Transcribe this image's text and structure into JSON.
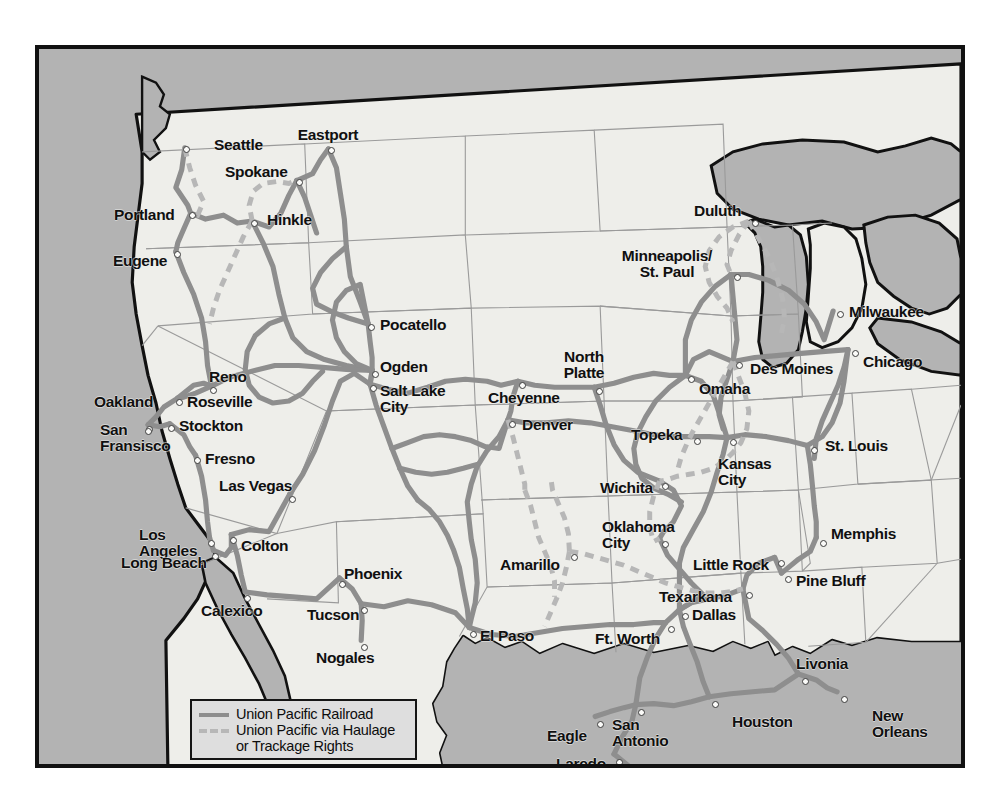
{
  "map": {
    "title": "Union Pacific Railroad System Map",
    "colors": {
      "ocean": "#b3b3b3",
      "land": "#eeeeea",
      "lakes": "#b3b3b3",
      "rail_line": "#8e8e8e",
      "haulage_line": "#b7b7b7",
      "border": "#111111",
      "state_line": "#9a9a9a",
      "label_text": "#101010",
      "legend_background": "#dedede",
      "page_background": "#ffffff",
      "city_dot_fill": "#fbfbf9",
      "city_dot_stroke": "#3c3c3c"
    },
    "frame": {
      "left": 35,
      "top": 45,
      "width": 930,
      "height": 723
    }
  },
  "legend": {
    "items": [
      {
        "style": "solid",
        "label": "Union Pacific Railroad"
      },
      {
        "style": "dashed",
        "label": "Union Pacific via Haulage\nor Trackage Rights"
      }
    ]
  },
  "cities": [
    {
      "name": "Seattle",
      "label": "Seattle",
      "dot_x": 147,
      "dot_y": 100,
      "label_x": 175,
      "label_y": 88,
      "align": "left"
    },
    {
      "name": "Eastport",
      "label": "Eastport",
      "dot_x": 292,
      "dot_y": 101,
      "label_x": 289,
      "label_y": 78,
      "align": "center"
    },
    {
      "name": "Spokane",
      "label": "Spokane",
      "dot_x": 260,
      "dot_y": 133,
      "label_x": 186,
      "label_y": 115,
      "align": "left"
    },
    {
      "name": "Portland",
      "label": "Portland",
      "dot_x": 153,
      "dot_y": 166,
      "label_x": 75,
      "label_y": 158,
      "align": "left"
    },
    {
      "name": "Hinkle",
      "label": "Hinkle",
      "dot_x": 215,
      "dot_y": 174,
      "label_x": 228,
      "label_y": 163,
      "align": "left"
    },
    {
      "name": "Eugene",
      "label": "Eugene",
      "dot_x": 138,
      "dot_y": 205,
      "label_x": 74,
      "label_y": 204,
      "align": "left"
    },
    {
      "name": "Pocatello",
      "label": "Pocatello",
      "dot_x": 332,
      "dot_y": 278,
      "label_x": 341,
      "label_y": 268,
      "align": "left"
    },
    {
      "name": "Ogden",
      "label": "Ogden",
      "dot_x": 336,
      "dot_y": 325,
      "label_x": 341,
      "label_y": 310,
      "align": "left"
    },
    {
      "name": "Salt Lake City",
      "label": "Salt Lake\nCity",
      "dot_x": 334,
      "dot_y": 339,
      "label_x": 341,
      "label_y": 334,
      "align": "left"
    },
    {
      "name": "North Platte",
      "label": "North\nPlatte",
      "dot_x": 560,
      "dot_y": 342,
      "label_x": 545,
      "label_y": 300,
      "align": "center"
    },
    {
      "name": "Duluth",
      "label": "Duluth",
      "dot_x": 716,
      "dot_y": 174,
      "label_x": 655,
      "label_y": 154,
      "align": "left"
    },
    {
      "name": "Minneapolis/St. Paul",
      "label": "Minneapolis/\nSt. Paul",
      "dot_x": 698,
      "dot_y": 228,
      "label_x": 628,
      "label_y": 199,
      "align": "center"
    },
    {
      "name": "Milwaukee",
      "label": "Milwaukee",
      "dot_x": 801,
      "dot_y": 265,
      "label_x": 810,
      "label_y": 255,
      "align": "left"
    },
    {
      "name": "Chicago",
      "label": "Chicago",
      "dot_x": 816,
      "dot_y": 304,
      "label_x": 824,
      "label_y": 305,
      "align": "left"
    },
    {
      "name": "Des Moines",
      "label": "Des Moines",
      "dot_x": 700,
      "dot_y": 316,
      "label_x": 711,
      "label_y": 312,
      "align": "left"
    },
    {
      "name": "Omaha",
      "label": "Omaha",
      "dot_x": 652,
      "dot_y": 330,
      "label_x": 660,
      "label_y": 332,
      "align": "left"
    },
    {
      "name": "Cheyenne",
      "label": "Cheyenne",
      "dot_x": 483,
      "dot_y": 336,
      "label_x": 449,
      "label_y": 341,
      "align": "left"
    },
    {
      "name": "Reno",
      "label": "Reno",
      "dot_x": 174,
      "dot_y": 341,
      "label_x": 170,
      "label_y": 320,
      "align": "left"
    },
    {
      "name": "Roseville",
      "label": "Roseville",
      "dot_x": 140,
      "dot_y": 353,
      "label_x": 148,
      "label_y": 345,
      "align": "left"
    },
    {
      "name": "Oakland",
      "label": "Oakland",
      "dot_x": 110,
      "dot_y": 380,
      "label_x": 55,
      "label_y": 345,
      "align": "left"
    },
    {
      "name": "Stockton",
      "label": "Stockton",
      "dot_x": 132,
      "dot_y": 379,
      "label_x": 140,
      "label_y": 369,
      "align": "left"
    },
    {
      "name": "Denver",
      "label": "Denver",
      "dot_x": 473,
      "dot_y": 375,
      "label_x": 483,
      "label_y": 368,
      "align": "left"
    },
    {
      "name": "Topeka",
      "label": "Topeka",
      "dot_x": 658,
      "dot_y": 392,
      "label_x": 592,
      "label_y": 378,
      "align": "left"
    },
    {
      "name": "St. Louis",
      "label": "St. Louis",
      "dot_x": 775,
      "dot_y": 401,
      "label_x": 786,
      "label_y": 389,
      "align": "left"
    },
    {
      "name": "San Fransisco",
      "label": "San\nFransisco",
      "dot_x": 109,
      "dot_y": 382,
      "label_x": 61,
      "label_y": 373,
      "align": "left"
    },
    {
      "name": "Fresno",
      "label": "Fresno",
      "dot_x": 158,
      "dot_y": 411,
      "label_x": 166,
      "label_y": 402,
      "align": "left"
    },
    {
      "name": "Kansas City",
      "label": "Kansas\nCity",
      "dot_x": 694,
      "dot_y": 393,
      "label_x": 679,
      "label_y": 407,
      "align": "left"
    },
    {
      "name": "Las Vegas",
      "label": "Las Vegas",
      "dot_x": 253,
      "dot_y": 450,
      "label_x": 180,
      "label_y": 429,
      "align": "left"
    },
    {
      "name": "Wichita",
      "label": "Wichita",
      "dot_x": 626,
      "dot_y": 437,
      "label_x": 561,
      "label_y": 431,
      "align": "left"
    },
    {
      "name": "Memphis",
      "label": "Memphis",
      "dot_x": 784,
      "dot_y": 494,
      "label_x": 792,
      "label_y": 477,
      "align": "left"
    },
    {
      "name": "Oklahoma City",
      "label": "Oklahoma\nCity",
      "dot_x": 626,
      "dot_y": 495,
      "label_x": 563,
      "label_y": 470,
      "align": "left"
    },
    {
      "name": "Los Angeles",
      "label": "Los\nAngeles",
      "dot_x": 172,
      "dot_y": 494,
      "label_x": 100,
      "label_y": 478,
      "align": "left"
    },
    {
      "name": "Colton",
      "label": "Colton",
      "dot_x": 194,
      "dot_y": 491,
      "label_x": 202,
      "label_y": 489,
      "align": "left"
    },
    {
      "name": "Long Beach",
      "label": "Long Beach",
      "dot_x": 176,
      "dot_y": 507,
      "label_x": 82,
      "label_y": 506,
      "align": "left"
    },
    {
      "name": "Amarillo",
      "label": "Amarillo",
      "dot_x": 535,
      "dot_y": 508,
      "label_x": 461,
      "label_y": 508,
      "align": "left"
    },
    {
      "name": "Little Rock",
      "label": "Little Rock",
      "dot_x": 742,
      "dot_y": 514,
      "label_x": 654,
      "label_y": 508,
      "align": "left"
    },
    {
      "name": "Phoenix",
      "label": "Phoenix",
      "dot_x": 303,
      "dot_y": 535,
      "label_x": 305,
      "label_y": 517,
      "align": "left"
    },
    {
      "name": "Pine Blu",
      "label": "Pine Bluff",
      "dot_x": 749,
      "dot_y": 530,
      "label_x": 757,
      "label_y": 524,
      "align": "left"
    },
    {
      "name": "Texarkana",
      "label": "Texarkana",
      "dot_x": 710,
      "dot_y": 546,
      "label_x": 620,
      "label_y": 540,
      "align": "left"
    },
    {
      "name": "Calexico",
      "label": "Calexico",
      "dot_x": 208,
      "dot_y": 549,
      "label_x": 162,
      "label_y": 554,
      "align": "left"
    },
    {
      "name": "Tucson",
      "label": "Tucson",
      "dot_x": 325,
      "dot_y": 561,
      "label_x": 268,
      "label_y": 558,
      "align": "left"
    },
    {
      "name": "Dallas",
      "label": "Dallas",
      "dot_x": 646,
      "dot_y": 567,
      "label_x": 653,
      "label_y": 558,
      "align": "left"
    },
    {
      "name": "Ft. Worth",
      "label": "Ft. Worth",
      "dot_x": 632,
      "dot_y": 580,
      "label_x": 556,
      "label_y": 582,
      "align": "left"
    },
    {
      "name": "El Paso",
      "label": "El Paso",
      "dot_x": 434,
      "dot_y": 585,
      "label_x": 441,
      "label_y": 579,
      "align": "left"
    },
    {
      "name": "Nogales",
      "label": "Nogales",
      "dot_x": 325,
      "dot_y": 598,
      "label_x": 277,
      "label_y": 601,
      "align": "left"
    },
    {
      "name": "Livonia",
      "label": "Livonia",
      "dot_x": 766,
      "dot_y": 632,
      "label_x": 757,
      "label_y": 607,
      "align": "left"
    },
    {
      "name": "New Orleans",
      "label": "New\nOrleans",
      "dot_x": 805,
      "dot_y": 650,
      "label_x": 833,
      "label_y": 659,
      "align": "left"
    },
    {
      "name": "Houston",
      "label": "Houston",
      "dot_x": 676,
      "dot_y": 655,
      "label_x": 693,
      "label_y": 665,
      "align": "left"
    },
    {
      "name": "San Antonio",
      "label": "San\nAntonio",
      "dot_x": 602,
      "dot_y": 663,
      "label_x": 573,
      "label_y": 668,
      "align": "left"
    },
    {
      "name": "Eagle",
      "label": "Eagle",
      "dot_x": 561,
      "dot_y": 675,
      "label_x": 508,
      "label_y": 679,
      "align": "left"
    },
    {
      "name": "Laredo",
      "label": "Laredo",
      "dot_x": 580,
      "dot_y": 713,
      "label_x": 517,
      "label_y": 707,
      "align": "left"
    },
    {
      "name": "Brownsville",
      "label": "Brownsville",
      "dot_x": 633,
      "dot_y": 755,
      "label_x": 641,
      "label_y": 746,
      "align": "left"
    }
  ]
}
